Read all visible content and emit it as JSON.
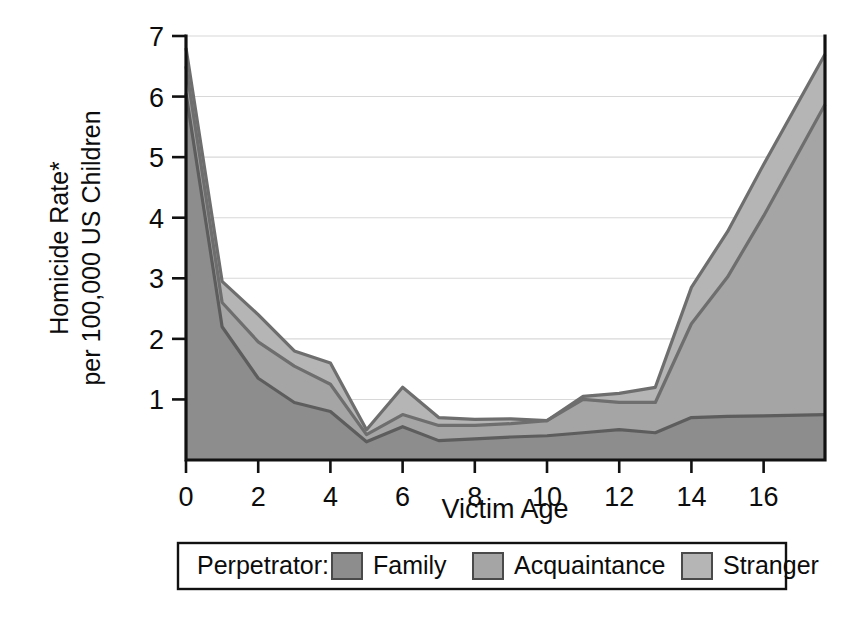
{
  "chart_data": {
    "type": "area",
    "stacked": true,
    "title": "",
    "xlabel": "Victim Age",
    "ylabel": "Homicide Rate*\nper 100,000 US Children",
    "ylabel_line1": "Homicide Rate*",
    "ylabel_line2": "per 100,000 US Children",
    "xlim": [
      0,
      17.7
    ],
    "ylim": [
      0,
      7
    ],
    "xticks": [
      0,
      2,
      4,
      6,
      8,
      10,
      12,
      14,
      16
    ],
    "xticklabels": [
      "0",
      "2",
      "4",
      "6",
      "8",
      "10",
      "12",
      "14",
      "16"
    ],
    "yticks": [
      0,
      1,
      2,
      3,
      4,
      5,
      6,
      7
    ],
    "yticklabels": [
      "",
      "1",
      "2",
      "3",
      "4",
      "5",
      "6",
      "7"
    ],
    "grid": true,
    "grid_axis": "y",
    "legend_position": "bottom",
    "legend_title": "Perpetrator:",
    "x": [
      0,
      1,
      2,
      3,
      4,
      5,
      6,
      7,
      8,
      9,
      10,
      11,
      12,
      13,
      14,
      15,
      16,
      17.7
    ],
    "series": [
      {
        "name": "Family",
        "color": "#8d8d8d",
        "values": [
          6.05,
          2.2,
          1.35,
          0.95,
          0.8,
          0.3,
          0.55,
          0.32,
          0.35,
          0.38,
          0.4,
          0.45,
          0.5,
          0.45,
          0.7,
          0.72,
          0.73,
          0.75
        ]
      },
      {
        "name": "Acquaintance",
        "color": "#a5a5a5",
        "values": [
          0.45,
          0.4,
          0.6,
          0.6,
          0.45,
          0.12,
          0.2,
          0.25,
          0.22,
          0.22,
          0.25,
          0.55,
          0.45,
          0.5,
          1.55,
          2.3,
          3.3,
          5.12
        ]
      },
      {
        "name": "Stranger",
        "color": "#b5b5b5",
        "values": [
          0.3,
          0.35,
          0.45,
          0.25,
          0.35,
          0.08,
          0.45,
          0.13,
          0.1,
          0.08,
          0.0,
          0.05,
          0.15,
          0.25,
          0.6,
          0.75,
          0.85,
          0.83
        ]
      }
    ],
    "cumulative": {
      "family": [
        6.05,
        2.2,
        1.35,
        0.95,
        0.8,
        0.3,
        0.55,
        0.32,
        0.35,
        0.38,
        0.4,
        0.45,
        0.5,
        0.45,
        0.7,
        0.72,
        0.73,
        0.75
      ],
      "family_acquaintance": [
        6.5,
        2.6,
        1.95,
        1.55,
        1.25,
        0.42,
        0.75,
        0.57,
        0.57,
        0.6,
        0.65,
        1.0,
        0.95,
        0.95,
        2.25,
        3.02,
        4.03,
        5.87
      ],
      "total": [
        6.8,
        2.95,
        2.4,
        1.8,
        1.6,
        0.5,
        1.2,
        0.7,
        0.67,
        0.68,
        0.65,
        1.05,
        1.1,
        1.2,
        2.85,
        3.77,
        4.88,
        6.7
      ]
    }
  },
  "legend": {
    "title": "Perpetrator:",
    "items": [
      {
        "label": "Family",
        "color": "#8d8d8d"
      },
      {
        "label": "Acquaintance",
        "color": "#a5a5a5"
      },
      {
        "label": "Stranger",
        "color": "#b5b5b5"
      }
    ]
  },
  "axes": {
    "x_title": "Victim Age",
    "y_title_line1": "Homicide Rate*",
    "y_title_line2": "per 100,000 US Children"
  },
  "colors": {
    "family": "#8d8d8d",
    "acquaintance": "#a5a5a5",
    "stranger": "#b5b5b5",
    "outline": "#6e6e6e",
    "axis": "#111111",
    "grid": "#d8d8d8",
    "background": "#ffffff"
  }
}
